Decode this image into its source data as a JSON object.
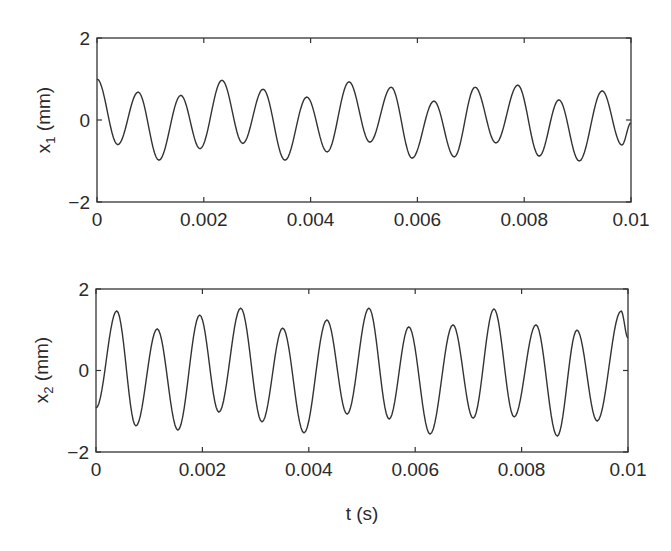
{
  "figure": {
    "xlabel": "t (s)",
    "panels": [
      {
        "id": "x1",
        "ylabel_main": "x",
        "ylabel_sub": "1",
        "ylabel_unit": " (mm)",
        "yticks": [
          "2",
          "0",
          "−2"
        ],
        "xticks": [
          "0",
          "0.002",
          "0.004",
          "0.006",
          "0.008",
          "0.01"
        ]
      },
      {
        "id": "x2",
        "ylabel_main": "x",
        "ylabel_sub": "2",
        "ylabel_unit": " (mm)",
        "yticks": [
          "2",
          "0",
          "−2"
        ],
        "xticks": [
          "0",
          "0.002",
          "0.004",
          "0.006",
          "0.008",
          "0.01"
        ]
      }
    ],
    "line_color": "#333333",
    "axis_color": "#333333"
  },
  "chart_data": [
    {
      "type": "line",
      "title": "",
      "xlabel": "",
      "ylabel": "x1 (mm)",
      "xlim": [
        0,
        0.01
      ],
      "ylim": [
        -2,
        2
      ],
      "xticks": [
        0,
        0.002,
        0.004,
        0.006,
        0.008,
        0.01
      ],
      "yticks": [
        -2,
        0,
        2
      ],
      "grid": false,
      "legend": null,
      "series": [
        {
          "name": "x1",
          "x": [
            0,
            0.00039,
            0.00077,
            0.00116,
            0.00157,
            0.00193,
            0.00234,
            0.00273,
            0.00311,
            0.00352,
            0.00393,
            0.00431,
            0.00472,
            0.00511,
            0.00551,
            0.0059,
            0.00631,
            0.00669,
            0.00708,
            0.00747,
            0.00788,
            0.00828,
            0.00865,
            0.00903,
            0.00946,
            0.00983,
            0.01
          ],
          "y": [
            1.0,
            -0.6,
            0.68,
            -0.98,
            0.6,
            -0.7,
            0.97,
            -0.57,
            0.75,
            -0.98,
            0.56,
            -0.78,
            0.93,
            -0.54,
            0.8,
            -0.93,
            0.46,
            -0.9,
            0.8,
            -0.56,
            0.85,
            -0.88,
            0.49,
            -1.0,
            0.71,
            -0.61,
            -0.07
          ]
        }
      ]
    },
    {
      "type": "line",
      "title": "",
      "xlabel": "t (s)",
      "ylabel": "x2 (mm)",
      "xlim": [
        0,
        0.01
      ],
      "ylim": [
        -2,
        2
      ],
      "xticks": [
        0,
        0.002,
        0.004,
        0.006,
        0.008,
        0.01
      ],
      "yticks": [
        -2,
        0,
        2
      ],
      "grid": false,
      "legend": null,
      "series": [
        {
          "name": "x2",
          "x": [
            0,
            0.00039,
            0.00075,
            0.00115,
            0.00154,
            0.00195,
            0.00231,
            0.00272,
            0.00312,
            0.00351,
            0.00391,
            0.00434,
            0.00472,
            0.00513,
            0.00551,
            0.00588,
            0.00628,
            0.00671,
            0.00709,
            0.00748,
            0.00786,
            0.00827,
            0.00867,
            0.00904,
            0.00942,
            0.00987,
            0.01
          ],
          "y": [
            -0.92,
            1.46,
            -1.36,
            1.02,
            -1.46,
            1.36,
            -1.02,
            1.53,
            -1.26,
            1.04,
            -1.53,
            1.24,
            -1.07,
            1.53,
            -1.19,
            1.07,
            -1.56,
            1.12,
            -1.17,
            1.51,
            -1.14,
            1.12,
            -1.61,
            0.99,
            -1.24,
            1.46,
            0.8
          ]
        }
      ]
    }
  ]
}
